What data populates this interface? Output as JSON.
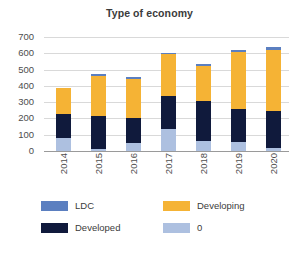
{
  "chart_data": {
    "type": "bar",
    "subtype": "stacked-column",
    "title": "Type of economy",
    "xlabel": "",
    "ylabel": "",
    "ylim": [
      0,
      700
    ],
    "yticks": [
      0,
      100,
      200,
      300,
      400,
      500,
      600,
      700
    ],
    "grid": true,
    "legend_position": "bottom",
    "categories": [
      "2014",
      "2015",
      "2016",
      "2017",
      "2018",
      "2019",
      "2020"
    ],
    "stack_order": [
      "0",
      "Developed",
      "Developing",
      "LDC"
    ],
    "series": [
      {
        "name": "0",
        "color": "#adc0e0",
        "values": [
          80,
          13,
          50,
          133,
          62,
          55,
          20
        ]
      },
      {
        "name": "Developed",
        "color": "#101a3c",
        "values": [
          150,
          200,
          150,
          207,
          245,
          200,
          225
        ]
      },
      {
        "name": "Developing",
        "color": "#f5b335",
        "values": [
          155,
          250,
          245,
          255,
          218,
          355,
          375
        ]
      },
      {
        "name": "LDC",
        "color": "#5b7fc0",
        "values": [
          5,
          8,
          8,
          10,
          12,
          12,
          18
        ]
      }
    ],
    "totals": [
      390,
      471,
      453,
      605,
      537,
      622,
      638
    ]
  },
  "legend": {
    "items": [
      {
        "label": "LDC",
        "color": "#5b7fc0"
      },
      {
        "label": "Developing",
        "color": "#f5b335"
      },
      {
        "label": "Developed",
        "color": "#101a3c"
      },
      {
        "label": "0",
        "color": "#adc0e0"
      }
    ]
  },
  "colors": {
    "gridline": "#d9d9d9",
    "axis": "#9a9a9a",
    "text": "#3b3b3b",
    "tick_text": "#4d4d4d",
    "background": "#ffffff"
  }
}
